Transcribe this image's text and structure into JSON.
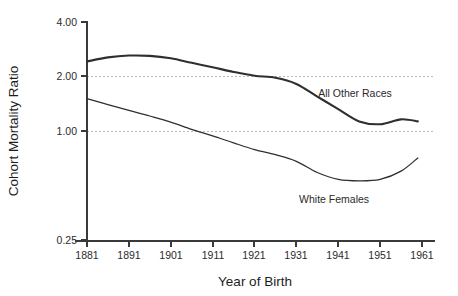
{
  "chart_data": {
    "type": "line",
    "title": "",
    "xlabel": "Year of Birth",
    "ylabel": "Cohort Mortality Ratio",
    "yscale": "log",
    "ylim": [
      0.25,
      4.0
    ],
    "xlim": [
      1881,
      1961
    ],
    "grid": "horizontal dashed gridlines at 1.00 and 2.00",
    "gridline_values": [
      2.0,
      1.0
    ],
    "legend_position": "inline annotations next to curves",
    "yticks": [
      4.0,
      2.0,
      1.0,
      0.25
    ],
    "ytick_labels": [
      "4.00",
      "2.00",
      "1.00",
      "0.25"
    ],
    "xticks": [
      1881,
      1891,
      1901,
      1911,
      1921,
      1931,
      1941,
      1951,
      1961
    ],
    "xtick_labels": [
      "1881",
      "1891",
      "1901",
      "1911",
      "1921",
      "1931",
      "1941",
      "1951",
      "1961"
    ],
    "x": [
      1881,
      1886,
      1891,
      1896,
      1901,
      1906,
      1911,
      1916,
      1921,
      1926,
      1931,
      1936,
      1941,
      1946,
      1951,
      1956,
      1960
    ],
    "series": [
      {
        "name": "All Other Races",
        "style": "thick",
        "color": "#2f2f2f",
        "values": [
          2.42,
          2.55,
          2.61,
          2.6,
          2.52,
          2.38,
          2.25,
          2.12,
          2.02,
          1.97,
          1.82,
          1.55,
          1.32,
          1.13,
          1.09,
          1.16,
          1.13
        ]
      },
      {
        "name": "White Females",
        "style": "thin",
        "color": "#2f2f2f",
        "values": [
          1.51,
          1.4,
          1.3,
          1.21,
          1.12,
          1.02,
          0.94,
          0.86,
          0.79,
          0.74,
          0.68,
          0.59,
          0.54,
          0.53,
          0.54,
          0.6,
          0.71
        ]
      }
    ],
    "annotations": [
      {
        "text": "All Other Races",
        "x": 1945,
        "y": 1.55
      },
      {
        "text": "White Females",
        "x": 1940,
        "y": 0.4
      }
    ]
  }
}
